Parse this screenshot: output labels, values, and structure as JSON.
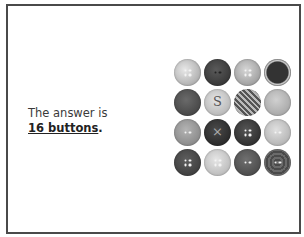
{
  "slide": {
    "text_line1": "The answer is",
    "text_line2_emphasis": "16 buttons",
    "text_line2_suffix": "."
  },
  "buttons": {
    "count": 16,
    "rows": 4,
    "cols": 4,
    "items": [
      {
        "name": "button-1",
        "bg": "radial-gradient(circle at 40% 40%, #e8e8e8, #9a9a9a)",
        "holes": "4"
      },
      {
        "name": "button-2",
        "bg": "radial-gradient(circle at 45% 40%, #5a5a5a, #2a2a2a)",
        "holes": "2dark"
      },
      {
        "name": "button-3",
        "bg": "radial-gradient(circle at 45% 40%, #d6d6d6, #8a8a8a)",
        "holes": "4"
      },
      {
        "name": "button-4",
        "bg": "radial-gradient(circle, #333 55%, #d8d8d8 62%, #555 75%)",
        "holes": "none"
      },
      {
        "name": "button-5",
        "bg": "radial-gradient(circle at 45% 40%, #6a6a6a, #3a3a3a)",
        "holes": "none"
      },
      {
        "name": "button-6",
        "bg": "radial-gradient(circle at 45% 40%, #e4e4e4, #a8a8a8)",
        "holes": "none",
        "glyph": "S"
      },
      {
        "name": "button-7",
        "bg": "repeating-linear-gradient(45deg, #555 0 2px, #bbb 2px 4px)",
        "holes": "none"
      },
      {
        "name": "button-8",
        "bg": "radial-gradient(circle at 45% 40%, #d0d0d0, #9a9a9a)",
        "holes": "none"
      },
      {
        "name": "button-9",
        "bg": "radial-gradient(circle at 45% 40%, #b4b4b4, #7a7a7a)",
        "holes": "2"
      },
      {
        "name": "button-10",
        "bg": "radial-gradient(circle at 45% 40%, #4a4a4a, #1e1e1e)",
        "holes": "none",
        "glyph": "×"
      },
      {
        "name": "button-11",
        "bg": "radial-gradient(circle at 45% 40%, #555, #222)",
        "holes": "4"
      },
      {
        "name": "button-12",
        "bg": "radial-gradient(circle at 45% 40%, #e0e0e0, #a4a4a4)",
        "holes": "2"
      },
      {
        "name": "button-13",
        "bg": "radial-gradient(circle at 45% 40%, #5e5e5e, #333)",
        "holes": "4"
      },
      {
        "name": "button-14",
        "bg": "radial-gradient(circle at 45% 40%, #e6e6e6, #acacac)",
        "holes": "4"
      },
      {
        "name": "button-15",
        "bg": "radial-gradient(circle at 45% 40%, #707070, #3e3e3e)",
        "holes": "2"
      },
      {
        "name": "button-16",
        "bg": "repeating-radial-gradient(circle, #6a6a6a 0 2px, #4a4a4a 2px 4px)",
        "holes": "2"
      }
    ]
  }
}
